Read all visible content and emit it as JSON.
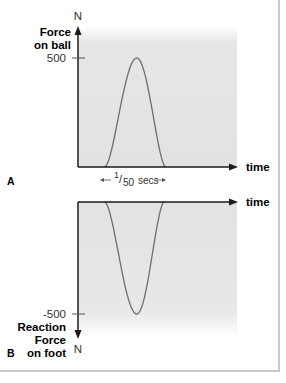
{
  "chart_data": [
    {
      "id": "A",
      "type": "line",
      "panel_label": "A",
      "title": "",
      "ylabel_lines": [
        "Force",
        "on ball"
      ],
      "yunit": "N",
      "xlabel": "time",
      "ytick_value": 500,
      "ytick_label": "500",
      "duration_annotation": {
        "prefix": "1",
        "suffix": "50",
        "unit": "secs"
      },
      "ylim": [
        0,
        700
      ],
      "xlim": [
        0,
        1
      ],
      "pulse": {
        "start": 0.17,
        "peak": 0.37,
        "end": 0.55,
        "peak_value": 500
      },
      "series": [
        {
          "name": "Force on ball",
          "shape": "positive pulse",
          "peak": 500
        }
      ]
    },
    {
      "id": "B",
      "type": "line",
      "panel_label": "B",
      "title": "",
      "ylabel_lines": [
        "Reaction",
        "Force",
        "on foot"
      ],
      "yunit": "N",
      "xlabel": "time",
      "ytick_value": -500,
      "ytick_label": "-500",
      "ylim": [
        -700,
        0
      ],
      "xlim": [
        0,
        1
      ],
      "pulse": {
        "start": 0.17,
        "peak": 0.37,
        "end": 0.54,
        "peak_value": -500
      },
      "series": [
        {
          "name": "Reaction Force on foot",
          "shape": "negative pulse",
          "peak": -500
        }
      ]
    }
  ],
  "colors": {
    "axis": "#1a1a1a",
    "curve": "#6e6e6e",
    "shade": "#e4e4e4",
    "frame": "#c9c9c9"
  }
}
